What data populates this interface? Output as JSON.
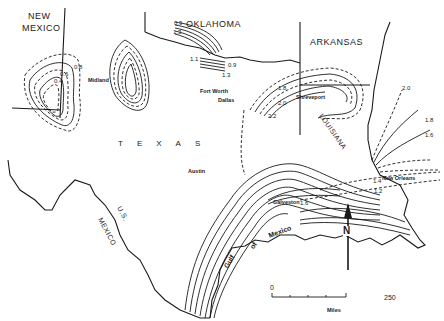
{
  "map": {
    "states": {
      "new_mexico": "NEW\nMEXICO",
      "new_mexico_line1": "NEW",
      "new_mexico_line2": "MEXICO",
      "oklahoma": "OKLAHOMA",
      "arkansas": "ARKANSAS",
      "texas": "TEXAS",
      "louisiana": "LOUISIANA",
      "mexico": "MEXICO",
      "us": "U.S."
    },
    "water": {
      "gulf": [
        "Gulf",
        "of",
        "Mexico"
      ]
    },
    "cities": [
      "Midland",
      "Fort Worth",
      "Dallas",
      "Shreveport",
      "Austin",
      "Galveston",
      "New Orleans"
    ],
    "contour_labels": {
      "nm_outer": "0.8",
      "nm_mid": "0.6",
      "nm_inner": "0.4",
      "ok_top1": "0.9",
      "ok_top2": "1.3",
      "ok_left": "1.1",
      "ok_right1": "0.9",
      "ok_right2": "1.3",
      "wtx_a": "0.2",
      "wtx_b": "1.8",
      "wtx_c": "1.6",
      "la_18": "1.8",
      "la_20": "2.0",
      "la_22": "2.2",
      "east_20": "2.0",
      "east_18": "1.8",
      "east_16": "1.6",
      "no_14": "1.4",
      "no_12": "1.2",
      "galv_16": "1.6",
      "stx_22": "2.2",
      "stx_20": "2.0",
      "stx_18": "1.8",
      "stx_17": "1.7",
      "stx_16": "1.6"
    },
    "scale": {
      "start": "0",
      "end": "250",
      "unit": "Miles"
    },
    "north_arrow": "N"
  }
}
